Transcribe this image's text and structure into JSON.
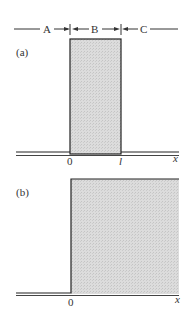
{
  "diagram": {
    "regions": {
      "a": "A",
      "b": "B",
      "c": "C"
    },
    "panel_a": {
      "label": "(a)",
      "tick_left": "0",
      "tick_right": "l",
      "axis_label": "x",
      "description": "Rectangular barrier of width l between x=0 and x=l"
    },
    "panel_b": {
      "label": "(b)",
      "tick_left": "0",
      "axis_label": "x",
      "description": "Step potential starting at x=0"
    },
    "colors": {
      "line": "#222222",
      "fill": "#d8d8d8",
      "text": "#333333"
    }
  }
}
